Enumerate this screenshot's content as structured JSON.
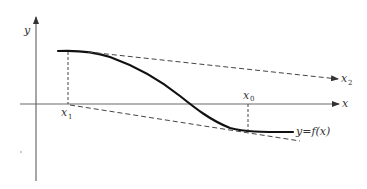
{
  "figure": {
    "type": "diagram",
    "colors": {
      "axis": "#6a6a6a",
      "curve": "#111111",
      "dashed": "#444444",
      "text": "#333333"
    }
  },
  "axes": {
    "x_label": "x",
    "y_label": "y"
  },
  "points": {
    "x1": {
      "label": "x",
      "subscript": "1"
    },
    "x0": {
      "label": "x",
      "subscript": "0"
    },
    "x2": {
      "label": "x",
      "subscript": "2"
    }
  },
  "curve": {
    "label": "y = f(x)",
    "label_text": "y=f(x)"
  }
}
